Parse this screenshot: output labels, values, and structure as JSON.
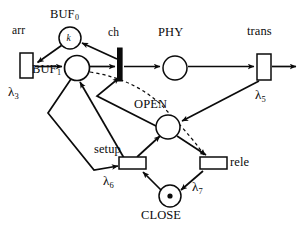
{
  "diagram": {
    "type": "petri-net",
    "background_color": "#ffffff",
    "stroke_color": "#0b0b0b",
    "places": [
      {
        "id": "buf0",
        "label": "BUF",
        "subscript": "0",
        "tokens": "k",
        "token_style": "text",
        "cx": 70,
        "cy": 38,
        "r": 11
      },
      {
        "id": "buf1",
        "label": "BUF",
        "subscript": "1",
        "tokens": "",
        "token_style": "none",
        "cx": 77,
        "cy": 68,
        "r": 12
      },
      {
        "id": "phy",
        "label": "PHY",
        "subscript": "",
        "tokens": "",
        "token_style": "none",
        "cx": 175,
        "cy": 68,
        "r": 12
      },
      {
        "id": "open",
        "label": "OPEN",
        "subscript": "",
        "tokens": "",
        "token_style": "none",
        "cx": 168,
        "cy": 127,
        "r": 12
      },
      {
        "id": "close",
        "label": "CLOSE",
        "subscript": "",
        "tokens": "1",
        "token_style": "dot",
        "cx": 170,
        "cy": 196,
        "r": 11
      }
    ],
    "transitions": [
      {
        "id": "arr",
        "label": "arr",
        "rate": "λ",
        "rate_sub": "3",
        "shape": "box",
        "x": 20,
        "y": 53,
        "w": 14,
        "h": 24
      },
      {
        "id": "ch",
        "label": "ch",
        "rate": "",
        "rate_sub": "",
        "shape": "bar",
        "x": 118,
        "y": 48,
        "w": 5,
        "h": 32
      },
      {
        "id": "trans",
        "label": "trans",
        "rate": "λ",
        "rate_sub": "5",
        "shape": "box",
        "x": 257,
        "y": 55,
        "w": 14,
        "h": 26
      },
      {
        "id": "setup",
        "label": "setup",
        "rate": "λ",
        "rate_sub": "6",
        "shape": "box",
        "x": 120,
        "y": 158,
        "w": 26,
        "h": 12
      },
      {
        "id": "rele",
        "label": "rele",
        "rate": "λ",
        "rate_sub": "7",
        "shape": "box",
        "x": 200,
        "y": 158,
        "w": 26,
        "h": 12
      }
    ],
    "labels": {
      "buf0": "BUF",
      "buf0_sub": "0",
      "buf1": "BUF",
      "buf1_sub": "1",
      "arr": "arr",
      "ch": "ch",
      "phy": "PHY",
      "trans": "trans",
      "open": "OPEN",
      "close": "CLOSE",
      "setup": "setup",
      "rele": "rele",
      "token_k": "k",
      "lambda": "λ",
      "lambda3_sub": "3",
      "lambda5_sub": "5",
      "lambda6_sub": "6",
      "lambda7_sub": "7"
    },
    "arcs": [
      {
        "from": "buf0",
        "to": "arr",
        "style": "solid",
        "note": "BUF0 to arr transition"
      },
      {
        "from": "arr",
        "to": "buf1",
        "style": "solid",
        "note": "arr to BUF1"
      },
      {
        "from": "buf1",
        "to": "ch",
        "style": "solid",
        "note": "BUF1 to ch"
      },
      {
        "from": "ch",
        "to": "buf0",
        "style": "solid",
        "note": "ch back to BUF0"
      },
      {
        "from": "ch",
        "to": "phy",
        "style": "solid",
        "note": "ch to PHY"
      },
      {
        "from": "phy",
        "to": "trans",
        "style": "solid",
        "note": "PHY to trans"
      },
      {
        "from": "trans",
        "to": "exit",
        "style": "solid",
        "note": "trans output to outside"
      },
      {
        "from": "trans",
        "to": "open",
        "style": "solid",
        "note": "trans to OPEN"
      },
      {
        "from": "open",
        "to": "rele",
        "style": "solid",
        "note": "OPEN to rele"
      },
      {
        "from": "rele",
        "to": "close",
        "style": "solid",
        "note": "rele to CLOSE"
      },
      {
        "from": "close",
        "to": "setup",
        "style": "solid",
        "note": "CLOSE to setup"
      },
      {
        "from": "setup",
        "to": "open",
        "style": "solid",
        "note": "setup to OPEN"
      },
      {
        "from": "buf1",
        "to": "setup",
        "style": "solid",
        "note": "BUF1 down to setup"
      },
      {
        "from": "setup",
        "to": "buf1",
        "style": "solid",
        "note": "setup back up to BUF1"
      },
      {
        "from": "open",
        "to": "ch",
        "style": "solid",
        "note": "OPEN to ch enabling"
      },
      {
        "from": "buf1",
        "to": "rele",
        "style": "dashed",
        "note": "inhibitor/dashed arc BUF1 to rele"
      }
    ]
  }
}
